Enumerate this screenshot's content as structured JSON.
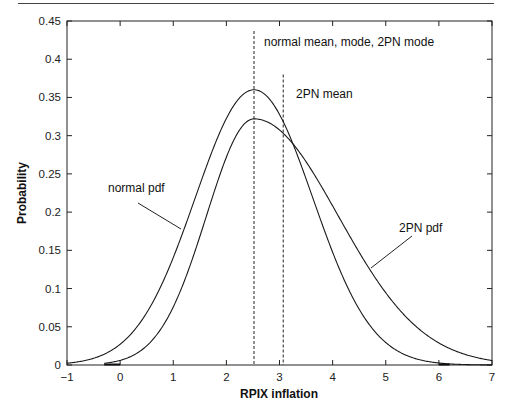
{
  "chart_data": {
    "type": "line",
    "title": "",
    "xlabel": "RPIX inflation",
    "ylabel": "Probability",
    "xlim": [
      -1,
      7
    ],
    "ylim": [
      0,
      0.45
    ],
    "grid": false,
    "xticks": [
      -1,
      0,
      1,
      2,
      3,
      4,
      5,
      6,
      7
    ],
    "yticks": [
      0,
      0.05,
      0.1,
      0.15,
      0.2,
      0.25,
      0.3,
      0.35,
      0.4,
      0.45
    ],
    "xtick_labels": [
      "−1",
      "0",
      "1",
      "2",
      "3",
      "4",
      "5",
      "6",
      "7"
    ],
    "ytick_labels": [
      "0",
      "0.05",
      "0.1",
      "0.15",
      "0.2",
      "0.25",
      "0.3",
      "0.35",
      "0.4",
      "0.45"
    ],
    "x": [
      -1,
      -0.5,
      0,
      0.5,
      1,
      1.5,
      2,
      2.5,
      3,
      3.5,
      4,
      4.5,
      5,
      5.5,
      6,
      6.5,
      7
    ],
    "series": [
      {
        "name": "normal pdf",
        "params": {
          "mean": 2.52,
          "sd": 1.108
        },
        "values": [
          0.0023,
          0.0088,
          0.027,
          0.068,
          0.14,
          0.236,
          0.323,
          0.36,
          0.328,
          0.243,
          0.148,
          0.073,
          0.029,
          0.0097,
          0.0026,
          0.0006,
          0.0001
        ]
      },
      {
        "name": "2PN pdf",
        "params": {
          "mode": 2.52,
          "sd_left": 0.894,
          "sd_right": 1.584,
          "mean": 3.07
        },
        "values": [
          0.0001,
          0.001,
          0.006,
          0.025,
          0.076,
          0.168,
          0.272,
          0.322,
          0.308,
          0.266,
          0.208,
          0.147,
          0.094,
          0.055,
          0.029,
          0.014,
          0.006
        ]
      }
    ],
    "vlines": [
      {
        "x": 2.52,
        "style": "dashed",
        "label": "normal mean, mode, 2PN mode"
      },
      {
        "x": 3.07,
        "style": "dashed",
        "label": "2PN mean"
      }
    ],
    "annotations": [
      {
        "text": "normal pdf",
        "points_to_series": "normal pdf"
      },
      {
        "text": "2PN pdf",
        "points_to_series": "2PN pdf"
      }
    ],
    "legend": null
  },
  "labels": {
    "xlabel": "RPIX inflation",
    "ylabel": "Probability",
    "vline1": "normal mean, mode, 2PN mode",
    "vline2": "2PN mean",
    "normal": "normal pdf",
    "twopn": "2PN pdf"
  },
  "colors": {
    "line": "#1a1a1a",
    "axis": "#222222",
    "background": "#ffffff"
  }
}
